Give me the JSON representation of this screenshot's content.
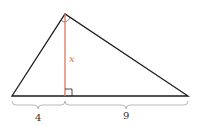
{
  "diagram": {
    "type": "right-triangle-altitude",
    "colors": {
      "triangle": "#1a1a1a",
      "altitude": "#d9775a",
      "brace": "#b0b0b0",
      "label": "#333333",
      "altitude_label": "#d9775a"
    },
    "altitude_label": "x",
    "segments": [
      {
        "label": "4"
      },
      {
        "label": "9"
      }
    ],
    "markers": [
      "right-angle-at-apex",
      "right-angle-at-foot"
    ]
  }
}
